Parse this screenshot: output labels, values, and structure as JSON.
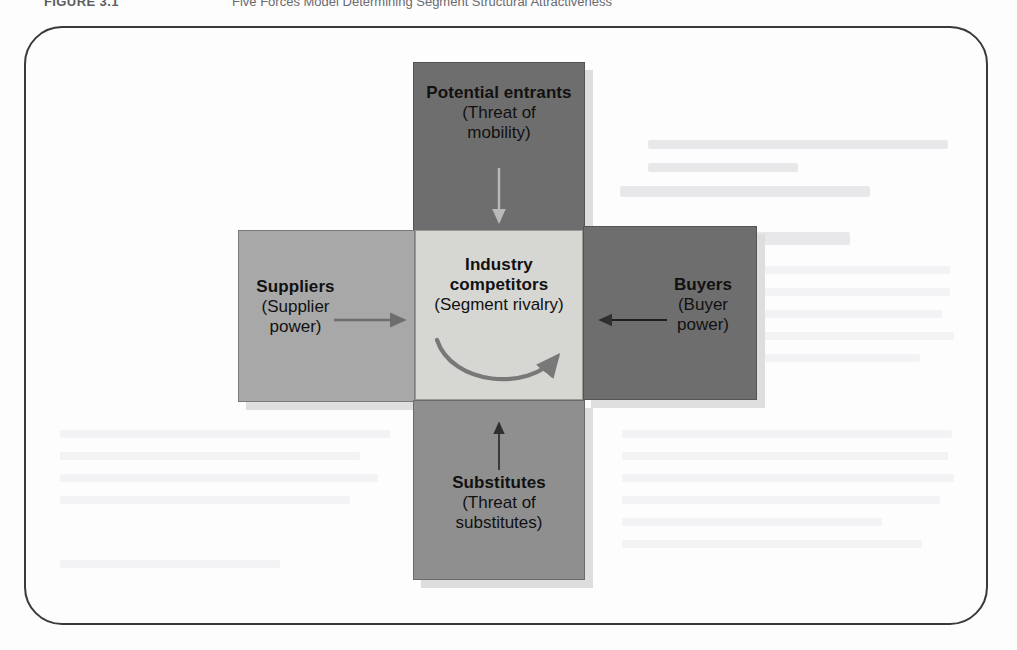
{
  "caption": {
    "label": "FIGURE 3.1",
    "title": "Five Forces Model Determining Segment Structural Attractiveness"
  },
  "diagram": {
    "name": "five-forces-model",
    "boxes": [
      {
        "key": "potential-entrants",
        "title": "Potential entrants",
        "subtitle": "(Threat of\nmobility)",
        "subtitle_line1": "(Threat of",
        "subtitle_line2": "mobility)",
        "color": "#6e6e6e",
        "position": "top",
        "arrow": "arrow-down"
      },
      {
        "key": "suppliers",
        "title": "Suppliers",
        "subtitle_line1": "(Supplier",
        "subtitle_line2": "power)",
        "color": "#a8a8a8",
        "position": "left",
        "arrow": "arrow-right"
      },
      {
        "key": "industry-competitors",
        "title_line1": "Industry",
        "title_line2": "competitors",
        "subtitle_line1": "(Segment rivalry)",
        "color": "#d6d6d2",
        "position": "center",
        "arrow": "arrow-curved-rivalry"
      },
      {
        "key": "buyers",
        "title": "Buyers",
        "subtitle_line1": "(Buyer",
        "subtitle_line2": "power)",
        "color": "#6e6e6e",
        "position": "right",
        "arrow": "arrow-left"
      },
      {
        "key": "substitutes",
        "title": "Substitutes",
        "subtitle_line1": "(Threat of",
        "subtitle_line2": "substitutes)",
        "color": "#8f8f8f",
        "position": "bottom",
        "arrow": "arrow-up"
      }
    ]
  },
  "colors": {
    "frame_border": "#3a3a3c",
    "box_shadow": "#dedede",
    "arrow_dark": "#2a2a2a",
    "arrow_light": "#c9c9c9",
    "arrow_mid": "#707070",
    "page_background": "#fdfdfd"
  }
}
